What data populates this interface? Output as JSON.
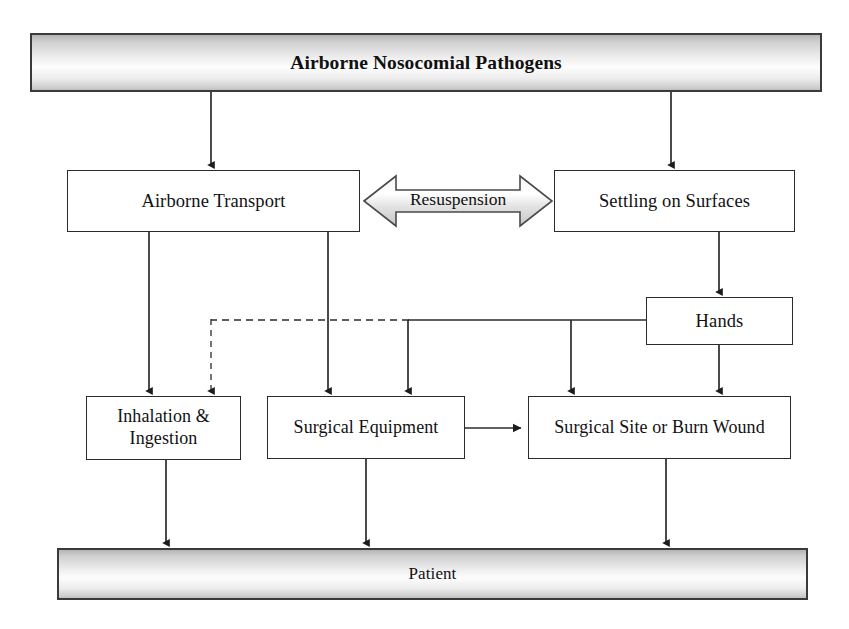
{
  "diagram": {
    "colors": {
      "stroke": "#2b2b2b",
      "banner_fill_light": "#fdfdfd",
      "banner_fill_dark": "#b4b4b4",
      "text": "#111111",
      "background": "#ffffff"
    },
    "nodes": {
      "pathogens": {
        "label": "Airborne Nosocomial Pathogens"
      },
      "airborne_transport": {
        "label": "Airborne Transport"
      },
      "settling": {
        "label": "Settling on Surfaces"
      },
      "hands": {
        "label": "Hands"
      },
      "inhalation": {
        "label": "Inhalation &\nIngestion"
      },
      "surgical_equipment": {
        "label": "Surgical Equipment"
      },
      "surgical_site": {
        "label": "Surgical Site or Burn Wound"
      },
      "patient": {
        "label": "Patient"
      }
    },
    "connectors": {
      "resuspension": {
        "label": "Resuspension",
        "style": "double-headed-arrow"
      }
    }
  }
}
